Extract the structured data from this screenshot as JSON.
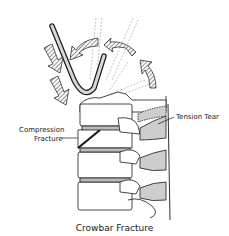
{
  "figure": {
    "title": "Crowbar Fracture",
    "labels": {
      "tension_tear": "Tension Tear",
      "compression_line1": "Compression",
      "compression_line2": "Fracture"
    },
    "colors": {
      "ink": "#1a1a1a",
      "hatch": "#555555",
      "background": "#ffffff",
      "crowbar_fill": "#d8d8d8"
    },
    "icons": [
      "down-arrow-icon",
      "curved-arrow-icon"
    ]
  }
}
